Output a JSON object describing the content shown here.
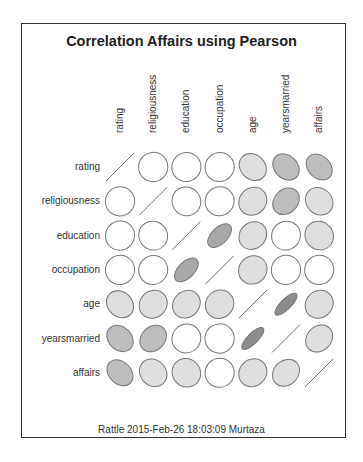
{
  "chart_data": {
    "type": "heatmap",
    "subtype": "correlation-ellipse",
    "title": "Correlation Affairs using Pearson",
    "method": "Pearson",
    "variables": [
      "rating",
      "religiousness",
      "education",
      "occupation",
      "age",
      "yearsmarried",
      "affairs"
    ],
    "matrix": [
      [
        1.0,
        0.01,
        0.02,
        0.02,
        -0.18,
        -0.24,
        -0.28
      ],
      [
        0.01,
        1.0,
        -0.04,
        0.03,
        0.1,
        0.22,
        -0.14
      ],
      [
        0.02,
        -0.04,
        1.0,
        0.53,
        0.13,
        0.04,
        -0.06
      ],
      [
        0.02,
        0.03,
        0.53,
        1.0,
        0.07,
        0.01,
        0.02
      ],
      [
        -0.18,
        0.1,
        0.13,
        0.07,
        1.0,
        0.78,
        0.1
      ],
      [
        -0.24,
        0.22,
        0.04,
        0.01,
        0.78,
        1.0,
        0.19
      ],
      [
        -0.28,
        -0.14,
        -0.06,
        0.02,
        0.1,
        0.19,
        1.0
      ]
    ],
    "xlabel": "",
    "ylabel": "",
    "grid": false,
    "legend": "none"
  },
  "footer": "Rattle 2015-Feb-26 18:03:09 Murtaza",
  "colors": {
    "stroke": "#777777",
    "fill_none": "#ffffff",
    "fill_light": "#dedede",
    "fill_medium": "#bdbdbd",
    "fill_dark": "#8c8c8c",
    "frame": "#333333"
  }
}
